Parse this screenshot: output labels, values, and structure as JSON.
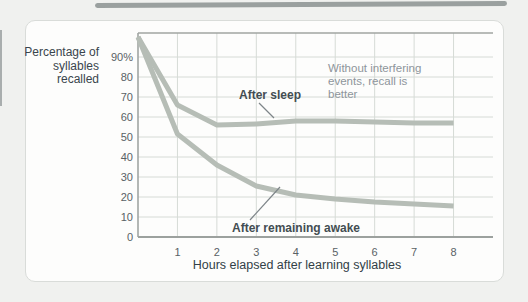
{
  "chart_data": {
    "type": "line",
    "title": "",
    "xlabel": "Hours elapsed after learning syllables",
    "ylabel": "Percentage of syllables recalled",
    "x_ticks": [
      "1",
      "2",
      "3",
      "4",
      "5",
      "6",
      "7",
      "8"
    ],
    "y_ticks": [
      "90%",
      "80",
      "70",
      "60",
      "50",
      "40",
      "30",
      "20",
      "10",
      "0"
    ],
    "xlim": [
      0,
      9
    ],
    "ylim": [
      0,
      102
    ],
    "grid": true,
    "legend_position": "inline-labels",
    "series": [
      {
        "name": "After sleep",
        "x": [
          0,
          1,
          2,
          3,
          4,
          5,
          6,
          7,
          8
        ],
        "values": [
          100,
          66,
          56,
          56.5,
          58,
          58,
          57.5,
          57,
          57
        ]
      },
      {
        "name": "After remaining awake",
        "x": [
          0,
          1,
          2,
          3,
          4,
          5,
          6,
          7,
          8
        ],
        "values": [
          100,
          51.5,
          36,
          25.5,
          21,
          19,
          17.5,
          16.5,
          15.5
        ]
      }
    ],
    "annotation": "Without interfering events, recall is better",
    "colors": {
      "line": "#b6bdb6",
      "grid": "#d6dbd6",
      "axis": "#a0a5a2",
      "bottom_axis": "#9ca19e",
      "tick_text": "#596165",
      "dark_text": "#3a454d",
      "annotation_text": "#8e959b",
      "leader_line": "#7e8589"
    }
  }
}
